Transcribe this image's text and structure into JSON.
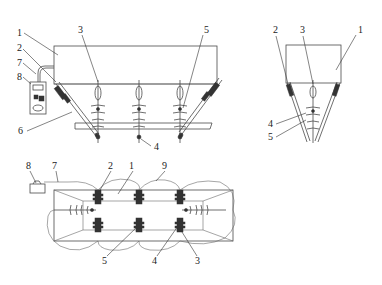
{
  "figure": {
    "views": [
      {
        "id": "front-view",
        "labels": [
          {
            "text": "1",
            "x": 17,
            "y": 36
          },
          {
            "text": "2",
            "x": 17,
            "y": 51
          },
          {
            "text": "7",
            "x": 17,
            "y": 66
          },
          {
            "text": "8",
            "x": 17,
            "y": 80
          },
          {
            "text": "3",
            "x": 78,
            "y": 33
          },
          {
            "text": "5",
            "x": 205,
            "y": 33
          },
          {
            "text": "6",
            "x": 20,
            "y": 134
          },
          {
            "text": "4",
            "x": 155,
            "y": 150
          }
        ]
      },
      {
        "id": "side-view",
        "labels": [
          {
            "text": "2",
            "x": 273,
            "y": 33
          },
          {
            "text": "3",
            "x": 300,
            "y": 33
          },
          {
            "text": "1",
            "x": 358,
            "y": 33
          },
          {
            "text": "4",
            "x": 269,
            "y": 127
          },
          {
            "text": "5",
            "x": 269,
            "y": 140
          }
        ]
      },
      {
        "id": "top-view",
        "labels": [
          {
            "text": "8",
            "x": 27,
            "y": 169
          },
          {
            "text": "7",
            "x": 53,
            "y": 169
          },
          {
            "text": "2",
            "x": 109,
            "y": 169
          },
          {
            "text": "1",
            "x": 130,
            "y": 169
          },
          {
            "text": "9",
            "x": 163,
            "y": 169
          },
          {
            "text": "5",
            "x": 104,
            "y": 263
          },
          {
            "text": "4",
            "x": 154,
            "y": 263
          },
          {
            "text": "3",
            "x": 197,
            "y": 263
          }
        ]
      }
    ]
  }
}
